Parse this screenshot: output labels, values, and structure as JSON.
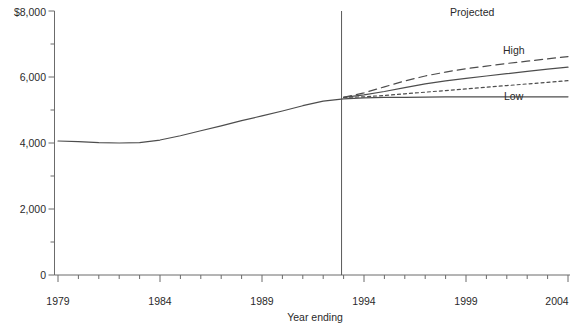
{
  "chart_data": {
    "type": "line",
    "title": "",
    "xlabel": "Year ending",
    "ylabel": "",
    "xlim": [
      1979,
      2004
    ],
    "ylim": [
      0,
      8000
    ],
    "grid": false,
    "legend_position": "inline-right",
    "x_ticks": [
      {
        "value": 1979,
        "label": "1979"
      },
      {
        "value": 1984,
        "label": "1984"
      },
      {
        "value": 1989,
        "label": "1989"
      },
      {
        "value": 1994,
        "label": "1994"
      },
      {
        "value": 1999,
        "label": "1999"
      },
      {
        "value": 2004,
        "label": "2004"
      }
    ],
    "x_minor_tick_interval": 1,
    "y_ticks": [
      {
        "value": 0,
        "label": "0"
      },
      {
        "value": 2000,
        "label": "2,000"
      },
      {
        "value": 4000,
        "label": "4,000"
      },
      {
        "value": 6000,
        "label": "6,000"
      },
      {
        "value": 8000,
        "label": "$8,000"
      }
    ],
    "y_minor_tick_interval": 1000,
    "annotations": [
      {
        "name": "projected-label",
        "text": "Projected",
        "x": 1997.6,
        "y": 7800
      },
      {
        "name": "high-series-label",
        "text": "High",
        "x": 2000.2,
        "y": 6480
      },
      {
        "name": "low-series-label",
        "text": "Low",
        "x": 2000.4,
        "y": 5450
      }
    ],
    "divider": {
      "name": "projection-divider",
      "x": 1992.9,
      "label": "Projected"
    },
    "x": [
      1979,
      1980,
      1981,
      1982,
      1983,
      1984,
      1985,
      1986,
      1987,
      1988,
      1989,
      1990,
      1991,
      1992,
      1993,
      1994,
      1995,
      1996,
      1997,
      1998,
      1999,
      2000,
      2001,
      2002,
      2003,
      2004
    ],
    "series": [
      {
        "name": "Actual",
        "style": "solid",
        "color": "#4d4d4d",
        "values": [
          4060,
          4040,
          4010,
          4000,
          4010,
          4090,
          4220,
          4370,
          4520,
          4680,
          4820,
          4970,
          5130,
          5270,
          5340,
          5370,
          5380,
          5380,
          5390,
          5400,
          5400,
          5400,
          5400,
          5400,
          5400,
          5400
        ]
      },
      {
        "name": "Projected (middle)",
        "style": "solid",
        "color": "#4d4d4d",
        "values": [
          null,
          null,
          null,
          null,
          null,
          null,
          null,
          null,
          null,
          null,
          null,
          null,
          null,
          null,
          5380,
          5460,
          5560,
          5680,
          5790,
          5880,
          5960,
          6030,
          6100,
          6170,
          6240,
          6300
        ]
      },
      {
        "name": "High",
        "style": "dashed",
        "color": "#4d4d4d",
        "values": [
          null,
          null,
          null,
          null,
          null,
          null,
          null,
          null,
          null,
          null,
          null,
          null,
          null,
          null,
          5380,
          5520,
          5700,
          5880,
          6030,
          6150,
          6250,
          6330,
          6410,
          6480,
          6550,
          6620
        ]
      },
      {
        "name": "Low",
        "style": "dotted",
        "color": "#4d4d4d",
        "values": [
          null,
          null,
          null,
          null,
          null,
          null,
          null,
          null,
          null,
          null,
          null,
          null,
          null,
          null,
          5380,
          5400,
          5440,
          5490,
          5540,
          5590,
          5640,
          5690,
          5740,
          5790,
          5840,
          5890
        ]
      }
    ]
  },
  "axis_titles": {
    "x": "Year ending"
  }
}
